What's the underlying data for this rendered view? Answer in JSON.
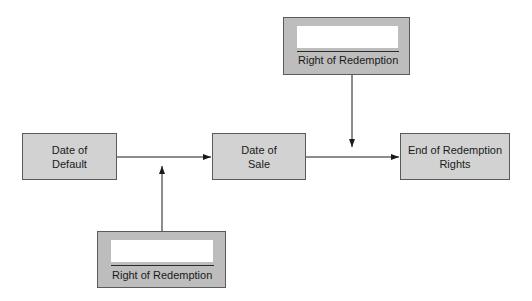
{
  "diagram": {
    "nodes": {
      "date_of_default": "Date of\nDefault",
      "date_of_sale": "Date of\nSale",
      "end_of_redemption": "End of Redemption\nRights"
    },
    "redemption_boxes": {
      "top": {
        "label": "Right of Redemption",
        "field_value": ""
      },
      "bottom": {
        "label": "Right of Redemption",
        "field_value": ""
      }
    },
    "edges": [
      {
        "from": "Date of Default",
        "to": "Date of Sale"
      },
      {
        "from": "Date of Sale",
        "to": "End of Redemption Rights"
      },
      {
        "from": "Right of Redemption (bottom)",
        "to": "edge Default→Sale"
      },
      {
        "from": "Right of Redemption (top)",
        "to": "edge Sale→End"
      }
    ],
    "colors": {
      "box_fill": "#d2d2d2",
      "redemption_fill": "#bdbdbd",
      "border": "#5a5a5a",
      "line": "#1a1a1a"
    }
  }
}
